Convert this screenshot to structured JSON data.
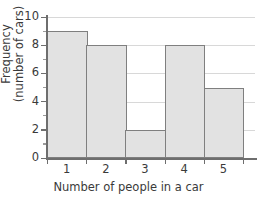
{
  "chart_data": {
    "type": "bar",
    "title": "",
    "categories": [
      "1",
      "2",
      "3",
      "4",
      "5"
    ],
    "values": [
      9,
      8,
      2,
      8,
      5
    ],
    "xlabel": "Number of people in a car",
    "ylabel_line1": "Frequency",
    "ylabel_line2": "(number of cars)",
    "ylim": [
      0,
      10
    ],
    "ytick_labels": [
      "0",
      "2",
      "4",
      "6",
      "8",
      "10"
    ],
    "ytick_values": [
      0,
      2,
      4,
      6,
      8,
      10
    ],
    "yminor_values": [
      1,
      3,
      5,
      7,
      9
    ],
    "grid": "horizontal",
    "legend": "none",
    "colors": {
      "bar_fill": "#e2e2e2",
      "bar_border": "#7f7f7f",
      "gridline": "#d8d8d8",
      "axis": "#6e6e6e",
      "text": "#3a3a3a",
      "background": "#ffffff"
    }
  }
}
